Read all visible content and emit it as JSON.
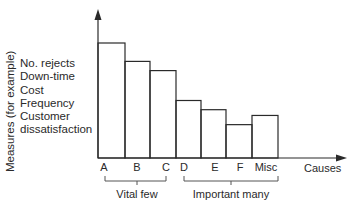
{
  "chart_data": {
    "type": "bar",
    "title": "",
    "xlabel": "Causes",
    "ylabel": "Measures (for example)",
    "categories": [
      "A",
      "B",
      "C",
      "D",
      "E",
      "F",
      "Misc"
    ],
    "values": [
      100,
      84,
      76,
      50,
      42,
      29,
      37
    ],
    "ylim": [
      0,
      130
    ],
    "grid": false,
    "bar_style": "outline",
    "measures_list": [
      "No. rejects",
      "Down-time",
      "Cost",
      "Frequency",
      "Customer",
      "dissatisfaction"
    ],
    "groups": [
      {
        "label": "Vital few",
        "categories": [
          "A",
          "B",
          "C"
        ]
      },
      {
        "label": "Important many",
        "categories": [
          "D",
          "E",
          "F",
          "Misc"
        ]
      }
    ]
  },
  "colors": {
    "line": "#2a2a2a",
    "background": "#ffffff"
  }
}
